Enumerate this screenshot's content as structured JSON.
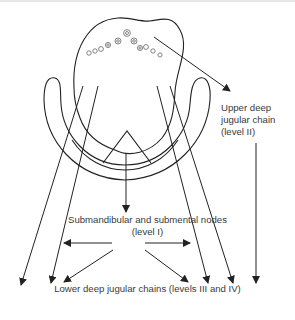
{
  "labels": {
    "upper_deep": {
      "line1": "Upper deep",
      "line2": "jugular chain",
      "line3": "(level II)"
    },
    "submandibular": {
      "line1": "Submandibular and submental nodes",
      "line2": "(level  I)"
    },
    "lower_deep": "Lower deep jugular chains  (levels III and IV)"
  },
  "colors": {
    "stroke": "#222222",
    "text": "#3a3a3a",
    "nodes": "#777777"
  }
}
